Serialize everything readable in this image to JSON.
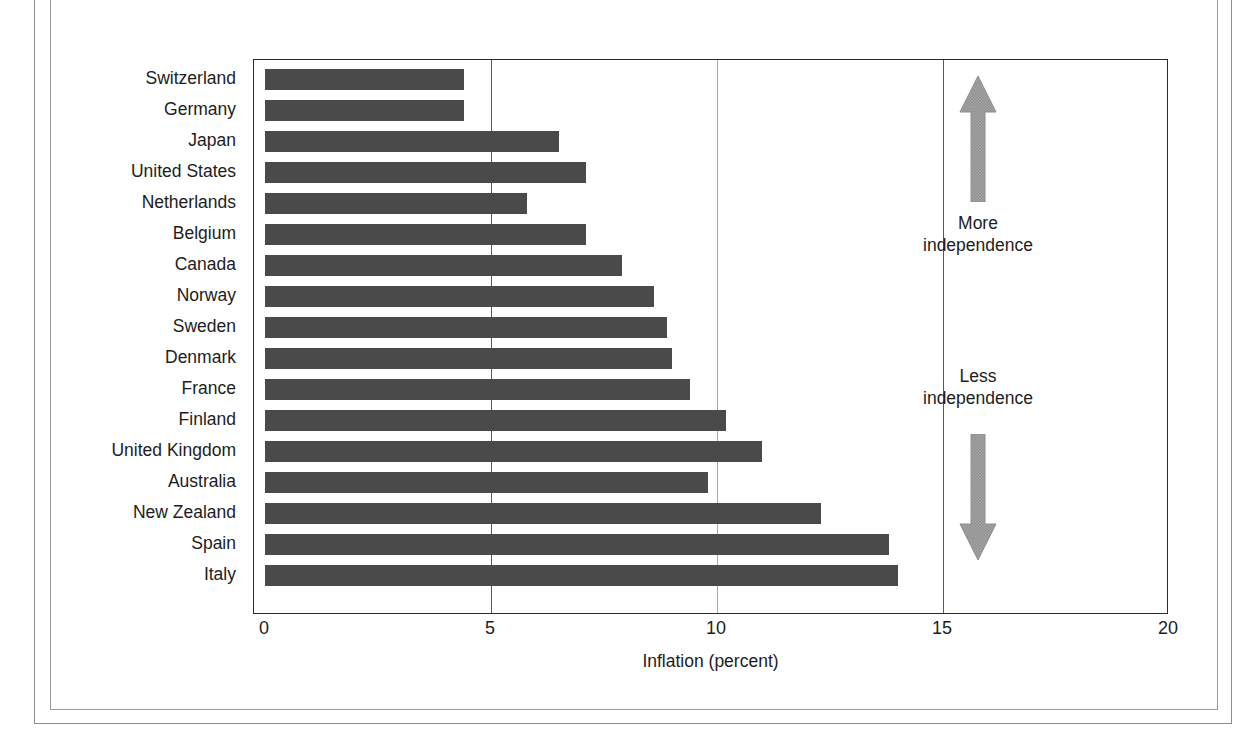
{
  "chart_data": {
    "type": "bar",
    "orientation": "horizontal",
    "title": "",
    "xlabel": "Inflation (percent)",
    "ylabel": "",
    "xlim": [
      0,
      20
    ],
    "xticks": [
      "0",
      "5",
      "10",
      "15",
      "20"
    ],
    "xtick_values": [
      0,
      5,
      10,
      15,
      20
    ],
    "grid": "vertical",
    "legend": "none",
    "bar_color": "#4a4a4a",
    "categories": [
      "Switzerland",
      "Germany",
      "Japan",
      "United States",
      "Netherlands",
      "Belgium",
      "Canada",
      "Norway",
      "Sweden",
      "Denmark",
      "France",
      "Finland",
      "United Kingdom",
      "Australia",
      "New Zealand",
      "Spain",
      "Italy"
    ],
    "values": [
      4.4,
      4.4,
      6.5,
      7.1,
      5.8,
      7.1,
      7.9,
      8.6,
      8.9,
      9.0,
      9.4,
      10.2,
      11.0,
      9.8,
      12.3,
      13.8,
      14.0
    ],
    "annotations": [
      {
        "text": "More\nindependence",
        "line1": "More",
        "line2": "independence",
        "arrow": "up",
        "arrow_color": "#9a9a9a"
      },
      {
        "text": "Less\nindependence",
        "line1": "Less",
        "line2": "independence",
        "arrow": "down",
        "arrow_color": "#9a9a9a"
      }
    ]
  },
  "figure": {
    "axis_title": "Inflation (percent)",
    "annotation_more_line1": "More",
    "annotation_more_line2": "independence",
    "annotation_less_line1": "Less",
    "annotation_less_line2": "independence"
  }
}
